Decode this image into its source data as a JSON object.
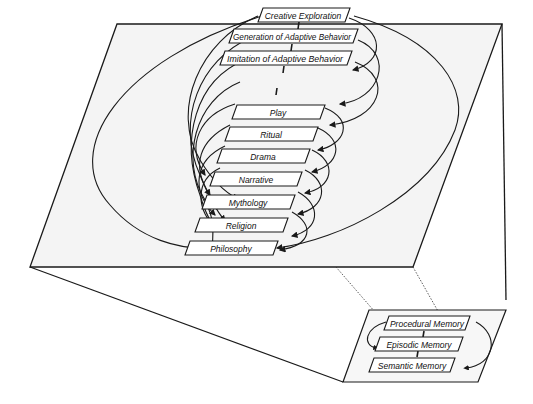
{
  "hierarchy": {
    "levels": [
      {
        "label": "Creative Exploration"
      },
      {
        "label": "Generation of Adaptive Behavior"
      },
      {
        "label": "Imitation of Adaptive Behavior"
      },
      {
        "label": "Play"
      },
      {
        "label": "Ritual"
      },
      {
        "label": "Drama"
      },
      {
        "label": "Narrative"
      },
      {
        "label": "Mythology"
      },
      {
        "label": "Religion"
      },
      {
        "label": "Philosophy"
      }
    ]
  },
  "memory": {
    "levels": [
      {
        "label": "Procedural Memory"
      },
      {
        "label": "Episodic Memory"
      },
      {
        "label": "Semantic Memory"
      }
    ]
  },
  "colors": {
    "stroke": "#1a1a1a",
    "plane_fill": "#f3f3f3",
    "box_fill": "#ffffff"
  }
}
